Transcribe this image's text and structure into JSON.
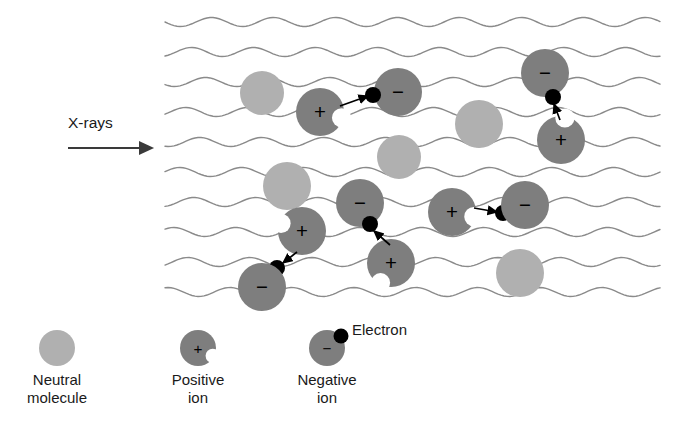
{
  "figure": {
    "title_label": "X-rays",
    "background_color": "#ffffff",
    "annotations": {
      "xray_label": "X-rays",
      "electron_callout": "Electron"
    },
    "colors": {
      "neutral_molecule": "#b0b0b0",
      "ion": "#7e7e7e",
      "electron": "#000000",
      "wave_line": "#8a8a8a",
      "arrow": "#000000",
      "xray_arrow": "#3a3a3a",
      "text": "#1a1a1a"
    },
    "charge_symbols": {
      "positive": "+",
      "negative": "−"
    }
  },
  "legend": {
    "items": [
      {
        "id": "neutral-molecule",
        "label_line1": "Neutral",
        "label_line2": "molecule",
        "kind": "neutral",
        "charge": "",
        "cx": 57,
        "cy": 348,
        "r": 18
      },
      {
        "id": "positive-ion",
        "label_line1": "Positive",
        "label_line2": "ion",
        "kind": "ion",
        "charge": "+",
        "cx": 198,
        "cy": 348,
        "r": 18
      },
      {
        "id": "negative-ion",
        "label_line1": "Negative",
        "label_line2": "ion",
        "kind": "ion",
        "charge": "−",
        "cx": 327,
        "cy": 348,
        "r": 18
      }
    ],
    "electron_label": "Electron"
  },
  "chart_data": {
    "type": "diagram",
    "wave_count": 10,
    "wave_x_start": 165,
    "wave_x_end": 662,
    "wave_y_values": [
      22,
      52,
      82,
      112,
      142,
      172,
      202,
      232,
      262,
      292
    ],
    "wave_amplitude": 4.5,
    "wave_period": 62,
    "particles": [
      {
        "id": "neutral-1",
        "kind": "neutral",
        "charge": "",
        "cx": 262,
        "cy": 93,
        "r": 22
      },
      {
        "id": "positive-1",
        "kind": "ion",
        "charge": "+",
        "cx": 320,
        "cy": 112,
        "r": 24,
        "notch_angle": 15
      },
      {
        "id": "negative-1",
        "kind": "ion",
        "charge": "−",
        "cx": 398,
        "cy": 92,
        "r": 24
      },
      {
        "id": "electron-1",
        "kind": "electron",
        "cx": 373,
        "cy": 95,
        "r": 8
      },
      {
        "id": "neutral-2",
        "kind": "neutral",
        "charge": "",
        "cx": 479,
        "cy": 124,
        "r": 24
      },
      {
        "id": "negative-2",
        "kind": "ion",
        "charge": "−",
        "cx": 545,
        "cy": 73,
        "r": 24
      },
      {
        "id": "electron-2",
        "kind": "electron",
        "cx": 553,
        "cy": 97,
        "r": 8
      },
      {
        "id": "positive-2",
        "kind": "ion",
        "charge": "+",
        "cx": 561,
        "cy": 140,
        "r": 24,
        "notch_angle": -80
      },
      {
        "id": "neutral-3",
        "kind": "neutral",
        "charge": "",
        "cx": 287,
        "cy": 186,
        "r": 24
      },
      {
        "id": "neutral-4",
        "kind": "neutral",
        "charge": "",
        "cx": 399,
        "cy": 157,
        "r": 22
      },
      {
        "id": "negative-3",
        "kind": "ion",
        "charge": "−",
        "cx": 360,
        "cy": 203,
        "r": 24
      },
      {
        "id": "electron-3",
        "kind": "electron",
        "cx": 370,
        "cy": 224,
        "r": 8
      },
      {
        "id": "positive-3",
        "kind": "ion",
        "charge": "+",
        "cx": 302,
        "cy": 231,
        "r": 24,
        "notch_angle": 200
      },
      {
        "id": "positive-4",
        "kind": "ion",
        "charge": "+",
        "cx": 391,
        "cy": 263,
        "r": 24,
        "notch_angle": 118
      },
      {
        "id": "positive-5",
        "kind": "ion",
        "charge": "+",
        "cx": 452,
        "cy": 212,
        "r": 24,
        "notch_angle": 12
      },
      {
        "id": "electron-4",
        "kind": "electron",
        "cx": 503,
        "cy": 213,
        "r": 8
      },
      {
        "id": "negative-4",
        "kind": "ion",
        "charge": "−",
        "cx": 525,
        "cy": 205,
        "r": 24
      },
      {
        "id": "electron-5",
        "kind": "electron",
        "cx": 277,
        "cy": 268,
        "r": 8
      },
      {
        "id": "negative-5",
        "kind": "ion",
        "charge": "−",
        "cx": 262,
        "cy": 287,
        "r": 24
      },
      {
        "id": "neutral-5",
        "kind": "neutral",
        "charge": "",
        "cx": 520,
        "cy": 273,
        "r": 24
      }
    ],
    "transfer_arrows": [
      {
        "id": "arrow-1",
        "x1": 340,
        "y1": 106,
        "x2": 368,
        "y2": 96
      },
      {
        "id": "arrow-2",
        "x1": 560,
        "y1": 120,
        "x2": 554,
        "y2": 104
      },
      {
        "id": "arrow-3",
        "x1": 390,
        "y1": 245,
        "x2": 374,
        "y2": 231
      },
      {
        "id": "arrow-4",
        "x1": 474,
        "y1": 208,
        "x2": 497,
        "y2": 212
      },
      {
        "id": "arrow-5",
        "x1": 297,
        "y1": 252,
        "x2": 283,
        "y2": 263
      }
    ],
    "xray_arrow": {
      "x1": 68,
      "y1": 148,
      "x2": 160,
      "y2": 148
    },
    "xray_label_position": {
      "x": 68,
      "y": 128
    }
  }
}
